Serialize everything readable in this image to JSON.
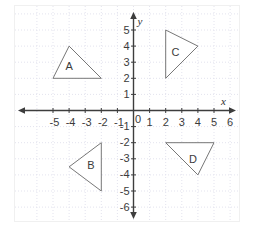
{
  "chart_data": {
    "type": "scatter",
    "title": "",
    "xlabel": "x",
    "ylabel": "y",
    "grid": true,
    "legend": "none",
    "xlim": [
      -6,
      7
    ],
    "ylim": [
      -7,
      6
    ],
    "x_ticks": [
      "-5",
      "-4",
      "-3",
      "-2",
      "-1",
      "0",
      "1",
      "2",
      "3",
      "4",
      "5",
      "6"
    ],
    "x_tick_values": [
      -5,
      -4,
      -3,
      -2,
      -1,
      0,
      1,
      2,
      3,
      4,
      5,
      6
    ],
    "y_ticks": [
      "5",
      "4",
      "3",
      "2",
      "1",
      "-1",
      "-2",
      "-3",
      "-4",
      "-5",
      "-6"
    ],
    "y_tick_values": [
      5,
      4,
      3,
      2,
      1,
      -1,
      -2,
      -3,
      -4,
      -5,
      -6
    ],
    "origin_label": "0",
    "shapes": [
      {
        "name": "A",
        "label": "A",
        "vertices": [
          [
            -5,
            2
          ],
          [
            -2,
            2
          ],
          [
            -4,
            4
          ]
        ],
        "label_at": [
          -4,
          2.75
        ]
      },
      {
        "name": "B",
        "label": "B",
        "vertices": [
          [
            -2,
            -2
          ],
          [
            -2,
            -5
          ],
          [
            -4,
            -3.5
          ]
        ],
        "label_at": [
          -2.65,
          -3.4
        ]
      },
      {
        "name": "C",
        "label": "C",
        "vertices": [
          [
            2,
            5
          ],
          [
            2,
            2
          ],
          [
            4,
            4
          ]
        ],
        "label_at": [
          2.6,
          3.6
        ]
      },
      {
        "name": "D",
        "label": "D",
        "vertices": [
          [
            2,
            -2
          ],
          [
            5,
            -2
          ],
          [
            4,
            -4
          ]
        ],
        "label_at": [
          3.7,
          -3.05
        ]
      }
    ],
    "colors": {
      "axis": "#3d3d3d",
      "grid": "#e3e3ee",
      "shape_stroke": "#777777",
      "shape_fill": "#ffffff",
      "text": "#3b3b3b",
      "background": "#ffffff",
      "frame": "#f0f0f0"
    }
  }
}
